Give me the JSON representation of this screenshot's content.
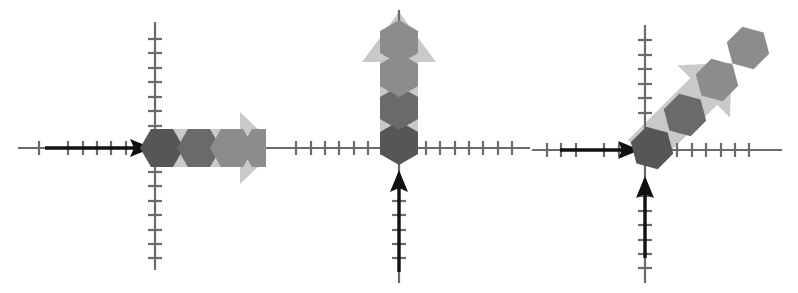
{
  "figure": {
    "width": 798,
    "height": 293,
    "background": "#ffffff",
    "panel_count": 3
  },
  "style": {
    "axis_color": "#6b6b6b",
    "axis_stroke_width": 2.2,
    "tick_color": "#6b6b6b",
    "tick_stroke_width": 2.2,
    "tick_length": 13,
    "tick_spacing": 14.5,
    "black_arrow_color": "#111111",
    "ghost_arrow_color": "#c9c9c9",
    "hex_colors": [
      "#171717",
      "#565656",
      "#6a6a6a",
      "#8c8c8c"
    ],
    "hex_radius": 22
  },
  "panels": [
    {
      "id": "panel-1",
      "name": "horizontal-vector-panel",
      "description": "Horizontal black arrow along negative x-axis meeting origin, followed by four hexagons extending right inside a light gray arrow",
      "origin": {
        "x": 155,
        "y": 148
      },
      "axes": {
        "x_axis": {
          "x1": 18,
          "y1": 148,
          "x2": 300,
          "y2": 148,
          "ticks": 18
        },
        "y_axis": {
          "x1": 155,
          "y1": 22,
          "x2": 155,
          "y2": 270,
          "ticks": 16
        }
      },
      "black_arrow": {
        "name": "x-axis-black-arrow",
        "from": {
          "x": 45,
          "y": 148
        },
        "to": {
          "x": 152,
          "y": 148
        },
        "direction": "right"
      },
      "ghost_arrow": {
        "name": "ghost-arrow-right",
        "direction": "right",
        "color": "#c9c9c9",
        "start": {
          "x": 150,
          "y": 148
        },
        "end": {
          "x": 272,
          "y": 148
        }
      },
      "hexagons": [
        {
          "cx": 162,
          "cy": 148,
          "color": "#171717"
        },
        {
          "cx": 199,
          "cy": 148,
          "color": "#565656"
        },
        {
          "cx": 232,
          "cy": 148,
          "color": "#6a6a6a"
        },
        {
          "cx": 263,
          "cy": 148,
          "color": "#8c8c8c"
        }
      ]
    },
    {
      "id": "panel-2",
      "name": "vertical-vector-panel",
      "description": "Vertical black arrow along negative y-axis meeting origin, followed by four hexagons extending up inside a light gray arrow",
      "origin": {
        "x": 133,
        "y": 148
      },
      "axes": {
        "x_axis": {
          "x1": 2,
          "y1": 148,
          "x2": 264,
          "y2": 148,
          "ticks": 17
        },
        "y_axis": {
          "x1": 133,
          "y1": 10,
          "x2": 133,
          "y2": 283,
          "ticks": 16
        }
      },
      "black_arrow": {
        "name": "y-axis-black-arrow",
        "from": {
          "x": 133,
          "y": 272
        },
        "to": {
          "x": 133,
          "y": 172
        },
        "direction": "up"
      },
      "ghost_arrow": {
        "name": "ghost-arrow-up",
        "direction": "up",
        "color": "#c9c9c9",
        "start": {
          "x": 133,
          "y": 152
        },
        "end": {
          "x": 133,
          "y": 12
        }
      },
      "hexagons": [
        {
          "cx": 133,
          "cy": 143,
          "color": "#171717"
        },
        {
          "cx": 133,
          "cy": 108,
          "color": "#565656"
        },
        {
          "cx": 133,
          "cy": 75,
          "color": "#6a6a6a"
        },
        {
          "cx": 133,
          "cy": 42,
          "color": "#8c8c8c"
        }
      ]
    },
    {
      "id": "panel-3",
      "name": "resultant-vector-panel",
      "description": "Horizontal black arrow and vertical black arrow both meeting the origin, with four hexagons extending diagonally up-right inside a light gray arrow",
      "origin": {
        "x": 113,
        "y": 150
      },
      "axes": {
        "x_axis": {
          "x1": 2,
          "y1": 150,
          "x2": 250,
          "y2": 150,
          "ticks": 16
        },
        "y_axis": {
          "x1": 113,
          "y1": 25,
          "x2": 113,
          "y2": 283,
          "ticks": 16
        }
      },
      "black_arrow_x": {
        "name": "x-axis-black-arrow",
        "from": {
          "x": 28,
          "y": 150
        },
        "to": {
          "x": 108,
          "y": 150
        },
        "direction": "right"
      },
      "black_arrow_y": {
        "name": "y-axis-black-arrow",
        "from": {
          "x": 113,
          "y": 258
        },
        "to": {
          "x": 113,
          "y": 178
        },
        "direction": "up"
      },
      "ghost_arrow": {
        "name": "ghost-arrow-diagonal",
        "direction": "up-right",
        "angle_degrees": 45,
        "color": "#c9c9c9",
        "start": {
          "x": 108,
          "y": 156
        },
        "end": {
          "x": 250,
          "y": 20
        }
      },
      "hexagons": [
        {
          "cx": 120,
          "cy": 148,
          "color": "#171717"
        },
        {
          "cx": 153,
          "cy": 115,
          "color": "#565656"
        },
        {
          "cx": 185,
          "cy": 80,
          "color": "#6a6a6a"
        },
        {
          "cx": 216,
          "cy": 48,
          "color": "#8c8c8c"
        }
      ]
    }
  ]
}
